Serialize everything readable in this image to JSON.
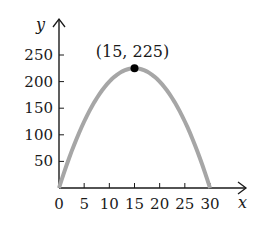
{
  "chart_data": {
    "type": "line",
    "title": "",
    "xlabel": "x",
    "ylabel": "y",
    "xlim": [
      0,
      30
    ],
    "ylim": [
      0,
      250
    ],
    "grid": false,
    "legend": null,
    "x_ticks": [
      0,
      5,
      10,
      15,
      20,
      25,
      30
    ],
    "x_tick_labels": [
      "0",
      "5",
      "10",
      "15",
      "20",
      "25",
      "30"
    ],
    "y_ticks": [
      50,
      100,
      150,
      200,
      250
    ],
    "y_tick_labels": [
      "50",
      "100",
      "150",
      "200",
      "250"
    ],
    "series": [
      {
        "name": "y = x(30 - x)",
        "color": "#a6a6a6",
        "x": [
          0,
          5,
          10,
          15,
          20,
          25,
          30
        ],
        "values": [
          0,
          125,
          200,
          225,
          200,
          125,
          0
        ]
      }
    ],
    "annotations": [
      {
        "text": "(15, 225)",
        "x": 15,
        "y": 225,
        "marker": "filled-circle",
        "color": "#000000"
      }
    ]
  },
  "labels": {
    "x_axis": "x",
    "y_axis": "y",
    "vertex": "(15, 225)"
  },
  "colors": {
    "curve": "#a6a6a6",
    "axis": "#1a1a1a",
    "point": "#000000"
  }
}
